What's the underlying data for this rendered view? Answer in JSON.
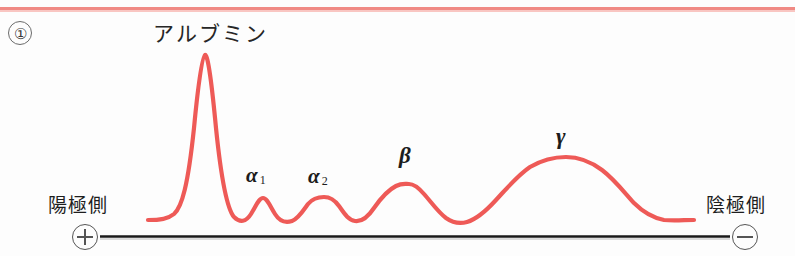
{
  "figure": {
    "number_label": "①",
    "title": "アルブミン",
    "top_rule_color": "#f08a84",
    "background_color": "#fdfdfd"
  },
  "axis": {
    "anode_label": "陽極側",
    "anode_symbol": "plus-in-circle",
    "cathode_label": "陰極側",
    "cathode_symbol": "minus-in-circle",
    "line_color": "#1a1a1a"
  },
  "chart_data": {
    "type": "line",
    "title": "アルブミン",
    "xlabel": "",
    "ylabel": "",
    "curve_color": "#ee5a57",
    "grid": false,
    "legend_position": "none",
    "annotations": [
      {
        "id": "albumin",
        "label": "アルブミン",
        "x": 205,
        "peak_height": 100
      },
      {
        "id": "alpha1",
        "label": "α",
        "subscript": "1",
        "x": 262,
        "peak_height": 14
      },
      {
        "id": "alpha2",
        "label": "α",
        "subscript": "2",
        "x": 324,
        "peak_height": 15
      },
      {
        "id": "beta",
        "label": "β",
        "subscript": "",
        "x": 408,
        "peak_height": 25
      },
      {
        "id": "gamma",
        "label": "γ",
        "subscript": "",
        "x": 566,
        "peak_height": 42
      }
    ],
    "baseline_y": 232,
    "x_start": 148,
    "x_end": 694,
    "fractions": [
      "アルブミン",
      "α1",
      "α2",
      "β",
      "γ"
    ],
    "relative_peak_values": [
      100,
      14,
      15,
      25,
      42
    ],
    "path": "M148,220 C160,220 168,219 174,214 C182,207 188,185 194,128 C198,86 202,56 205,55 C208,54 212,86 216,128 C222,187 228,210 234,217 C240,223 246,222 251,214 C256,206 259,198 263,198 C267,198 270,206 275,214 C280,222 286,223 292,221 C298,219 303,211 308,204 C313,198 318,197 324,197 C330,197 334,199 339,206 C344,213 348,220 355,221 C362,222 368,217 374,208 C381,198 388,190 396,186 C402,183 405,184 409,184 C414,184 418,187 424,194 C432,203 438,212 446,218 C453,223 460,224 467,222 C477,219 486,211 496,200 C508,187 518,175 530,167 C542,160 554,157 566,157 C578,157 590,161 602,170 C614,179 624,192 634,203 C644,213 654,218 664,220 C674,221 684,220 694,220"
  }
}
